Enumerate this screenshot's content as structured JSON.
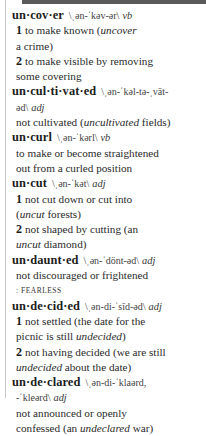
{
  "entries": [
    {
      "headword": "un·cov·er",
      "pron": "\\ˌən-ˈkəv-ər\\",
      "pos": "vb",
      "senses": [
        {
          "num": "1",
          "l1": "to make known ",
          "ex_open": "(",
          "ex": "uncover",
          "l2": "a crime)"
        },
        {
          "num": "2",
          "l1": "to make visible by removing",
          "l2": "some covering"
        }
      ]
    },
    {
      "headword": "un·cul·ti·vat·ed",
      "pron": "\\ˌən-ˈkəl-tə-ˌvāt-",
      "pron2": "əd\\",
      "pos": "adj",
      "def_pre": "not cultivated (",
      "def_ex": "uncultivated",
      "def_post": " fields)"
    },
    {
      "headword": "un·curl",
      "pron": "\\ˌən-ˈkərl\\",
      "pos": "vb",
      "def_l1": "to make or become straightened",
      "def_l2": "out from a curled position"
    },
    {
      "headword": "un·cut",
      "pron": "\\ˌən-ˈkət\\",
      "pos": "adj",
      "senses": [
        {
          "num": "1",
          "l1": "not cut down or cut into",
          "ex": "uncut",
          "l2_post": " forests)"
        },
        {
          "num": "2",
          "l1": "not shaped by cutting (an",
          "ex": "uncut",
          "l2_post": " diamond)"
        }
      ]
    },
    {
      "headword": "un·daunt·ed",
      "pron": "\\ˌən-ˈdönt-əd\\",
      "pos": "adj",
      "def_l1": "not discouraged or frightened",
      "syn": ": FEARLESS"
    },
    {
      "headword": "un·de·cid·ed",
      "pron": "\\ˌən-di-ˈsīd-əd\\",
      "pos": "adj",
      "senses": [
        {
          "num": "1",
          "l1": "not settled (the date for the",
          "l2_pre": "picnic is still ",
          "ex": "undecided",
          "l2_post": ")"
        },
        {
          "num": "2",
          "l1": "not having decided (we are still",
          "ex": "undecided",
          "l2_post": " about the date)"
        }
      ]
    },
    {
      "headword": "un·de·clared",
      "pron": "\\ˌən-di-ˈklaərd,",
      "pron2": "-ˈkleərd\\",
      "pos": "adj",
      "def_l1": "not announced or openly",
      "def_pre": "confessed (an ",
      "def_ex": "undeclared",
      "def_post": " war)"
    }
  ]
}
